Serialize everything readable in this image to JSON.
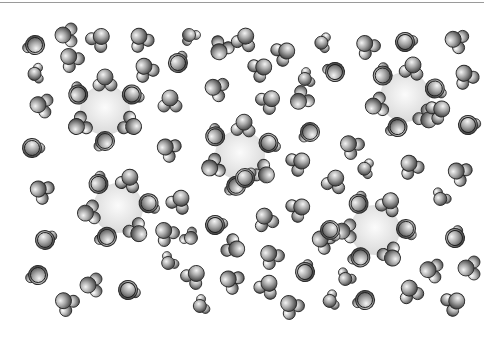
{
  "figure": {
    "colors": {
      "background": "#ffffff",
      "ion_fill": "#e6e6e6",
      "molecule_dark": "#4a4a4a",
      "molecule_light": "#f2f2f2",
      "outline": "#2a2a2a",
      "top_rule": "#9a9a9a"
    }
  },
  "ions": [
    {
      "x": 105,
      "y": 110,
      "r": 25
    },
    {
      "x": 240,
      "y": 155,
      "r": 25
    },
    {
      "x": 405,
      "y": 97,
      "r": 25
    },
    {
      "x": 118,
      "y": 208,
      "r": 25
    },
    {
      "x": 375,
      "y": 230,
      "r": 25
    }
  ],
  "free_waters": [
    [
      35,
      45,
      200,
      "front"
    ],
    [
      65,
      35,
      -90,
      "v"
    ],
    [
      100,
      38,
      40,
      "v"
    ],
    [
      140,
      38,
      -30,
      "v"
    ],
    [
      190,
      35,
      90,
      "s"
    ],
    [
      178,
      63,
      -20,
      "front"
    ],
    [
      220,
      50,
      -150,
      "v"
    ],
    [
      245,
      38,
      20,
      "v"
    ],
    [
      285,
      52,
      60,
      "v"
    ],
    [
      322,
      42,
      40,
      "s"
    ],
    [
      366,
      45,
      -40,
      "v"
    ],
    [
      405,
      42,
      30,
      "front"
    ],
    [
      455,
      40,
      -70,
      "v"
    ],
    [
      35,
      73,
      30,
      "s"
    ],
    [
      70,
      58,
      -40,
      "v"
    ],
    [
      145,
      68,
      -30,
      "v"
    ],
    [
      215,
      88,
      -70,
      "v"
    ],
    [
      262,
      68,
      60,
      "v"
    ],
    [
      305,
      78,
      10,
      "s"
    ],
    [
      335,
      72,
      -120,
      "front"
    ],
    [
      465,
      75,
      -30,
      "v"
    ],
    [
      40,
      105,
      -80,
      "v"
    ],
    [
      170,
      100,
      0,
      "v"
    ],
    [
      270,
      100,
      50,
      "v"
    ],
    [
      300,
      100,
      -130,
      "v"
    ],
    [
      440,
      110,
      60,
      "v"
    ],
    [
      32,
      148,
      40,
      "front"
    ],
    [
      167,
      148,
      -60,
      "v"
    ],
    [
      310,
      132,
      180,
      "front"
    ],
    [
      350,
      145,
      -50,
      "v"
    ],
    [
      468,
      125,
      30,
      "front"
    ],
    [
      300,
      162,
      60,
      "v"
    ],
    [
      335,
      180,
      20,
      "v"
    ],
    [
      365,
      168,
      40,
      "s"
    ],
    [
      410,
      165,
      -30,
      "v"
    ],
    [
      458,
      172,
      -60,
      "v"
    ],
    [
      40,
      190,
      -60,
      "v"
    ],
    [
      180,
      200,
      30,
      "v"
    ],
    [
      215,
      225,
      30,
      "front"
    ],
    [
      245,
      178,
      0,
      "front"
    ],
    [
      265,
      218,
      -20,
      "v"
    ],
    [
      300,
      208,
      60,
      "v"
    ],
    [
      440,
      198,
      -20,
      "s"
    ],
    [
      45,
      240,
      10,
      "front"
    ],
    [
      165,
      232,
      -40,
      "v"
    ],
    [
      190,
      238,
      -100,
      "s"
    ],
    [
      235,
      248,
      120,
      "v"
    ],
    [
      270,
      255,
      -40,
      "v"
    ],
    [
      322,
      240,
      -60,
      "v"
    ],
    [
      455,
      238,
      -30,
      "front"
    ],
    [
      38,
      275,
      200,
      "front"
    ],
    [
      90,
      285,
      -90,
      "v"
    ],
    [
      65,
      302,
      -50,
      "v"
    ],
    [
      128,
      290,
      60,
      "front"
    ],
    [
      168,
      262,
      -10,
      "s"
    ],
    [
      195,
      275,
      40,
      "v"
    ],
    [
      200,
      305,
      10,
      "s"
    ],
    [
      230,
      280,
      -60,
      "v"
    ],
    [
      268,
      285,
      30,
      "v"
    ],
    [
      305,
      272,
      -30,
      "front"
    ],
    [
      345,
      278,
      -20,
      "s"
    ],
    [
      290,
      305,
      -40,
      "v"
    ],
    [
      330,
      300,
      20,
      "s"
    ],
    [
      365,
      300,
      200,
      "front"
    ],
    [
      410,
      290,
      -20,
      "v"
    ],
    [
      430,
      270,
      -80,
      "v"
    ],
    [
      468,
      268,
      -90,
      "v"
    ],
    [
      455,
      302,
      60,
      "v"
    ],
    [
      330,
      230,
      90,
      "front"
    ]
  ],
  "shell_angles": [
    -90,
    -30,
    30,
    90,
    150,
    210
  ]
}
